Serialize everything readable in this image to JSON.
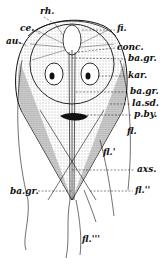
{
  "figure": {
    "labels": [
      {
        "id": "rh",
        "text": "rh.",
        "x": 40,
        "y": 7
      },
      {
        "id": "ce",
        "text": "ce.",
        "x": 20,
        "y": 24
      },
      {
        "id": "au",
        "text": "au.",
        "x": 6,
        "y": 37
      },
      {
        "id": "fi",
        "text": "fi.",
        "x": 117,
        "y": 24
      },
      {
        "id": "conc",
        "text": "conc.",
        "x": 117,
        "y": 43
      },
      {
        "id": "ba_gr_1",
        "text": "ba.gr.",
        "x": 128,
        "y": 54
      },
      {
        "id": "kar",
        "text": "kar.",
        "x": 128,
        "y": 71
      },
      {
        "id": "ba_gr_2",
        "text": "ba.gr.",
        "x": 130,
        "y": 87
      },
      {
        "id": "la_sd",
        "text": "la.sd.",
        "x": 132,
        "y": 99
      },
      {
        "id": "p_by",
        "text": "p.by.",
        "x": 134,
        "y": 110
      },
      {
        "id": "fl",
        "text": "fl.",
        "x": 127,
        "y": 127
      },
      {
        "id": "fl_prime",
        "text": "fl.'",
        "x": 103,
        "y": 148
      },
      {
        "id": "axs",
        "text": "axs.",
        "x": 137,
        "y": 165
      },
      {
        "id": "fl_dprime",
        "text": "fl.''",
        "x": 135,
        "y": 186
      },
      {
        "id": "ba_gr_3",
        "text": "ba.gr.",
        "x": 10,
        "y": 187
      },
      {
        "id": "fl_tprime",
        "text": "fl.'''",
        "x": 82,
        "y": 235
      }
    ]
  }
}
